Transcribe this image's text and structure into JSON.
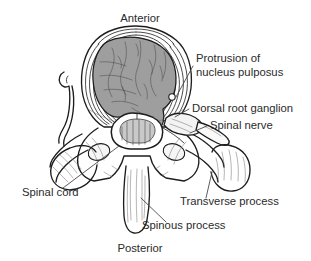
{
  "figure": {
    "background_color": "#ffffff",
    "line_color": "#1d1d1d",
    "text_color": "#2b2b2b"
  },
  "orientation_labels": {
    "top": "Anterior",
    "bottom": "Posterior"
  },
  "labels": [
    {
      "id": "protrusion",
      "line1": "Protrusion of",
      "line2": "nucleus pulposus",
      "align": "left",
      "x": 196,
      "y": 62
    },
    {
      "id": "dorsal-root-ganglion",
      "line1": "Dorsal root ganglion",
      "line2": "",
      "align": "left",
      "x": 192,
      "y": 112
    },
    {
      "id": "spinal-nerve",
      "line1": "Spinal nerve",
      "line2": "",
      "align": "left",
      "x": 210,
      "y": 129
    },
    {
      "id": "spinal-cord",
      "line1": "Spinal cord",
      "line2": "",
      "align": "left",
      "x": 22,
      "y": 196
    },
    {
      "id": "transverse-process",
      "line1": "Transverse process",
      "line2": "",
      "align": "left",
      "x": 180,
      "y": 205
    },
    {
      "id": "spinous-process",
      "line1": "Spinous process",
      "line2": "",
      "align": "left",
      "x": 142,
      "y": 229
    }
  ],
  "anatomy_parts": [
    {
      "name": "nucleus-pulposus",
      "fill": "#9c9c9c",
      "description": "protruding gray nuclear mass"
    },
    {
      "name": "annulus-fibrosus",
      "fill": "none",
      "description": "concentric lamellar rings of disc"
    },
    {
      "name": "vertebral-body",
      "fill": "#fbfbfb",
      "description": "anterior bone body"
    },
    {
      "name": "spinal-cord",
      "fill": "#ffffff",
      "description": "butterfly gray matter in vertebral canal"
    },
    {
      "name": "dorsal-root-ganglion",
      "fill": "#f2f2f2",
      "description": "swelling on nerve root"
    },
    {
      "name": "spinal-nerve",
      "fill": "#f7f7f7",
      "description": "nerve trunk exiting laterally"
    },
    {
      "name": "transverse-process-left",
      "fill": "#f0f0f0",
      "description": "left lateral bony process"
    },
    {
      "name": "transverse-process-right",
      "fill": "#f0f0f0",
      "description": "right lateral bony process"
    },
    {
      "name": "spinous-process",
      "fill": "#f4f4f4",
      "description": "posterior midline bony process"
    },
    {
      "name": "superior-articular-process-left",
      "fill": "#f4f4f4",
      "description": "left facet"
    },
    {
      "name": "superior-articular-process-right",
      "fill": "#f4f4f4",
      "description": "right facet"
    },
    {
      "name": "lamina",
      "fill": "#f4f4f4",
      "description": "posterior arch"
    }
  ]
}
